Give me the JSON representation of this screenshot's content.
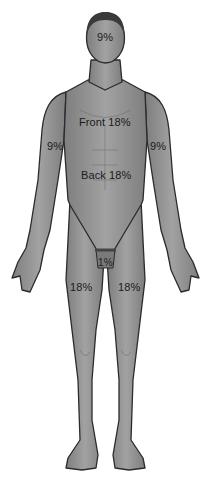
{
  "diagram": {
    "colors": {
      "skin": "#8e8e8e",
      "skin_light": "#a4a4a4",
      "outline": "#2b2b2b",
      "hair": "#3a3a3a",
      "label": "#1a1a1a",
      "background": "#ffffff"
    },
    "regions": [
      {
        "id": "head",
        "label": "9%"
      },
      {
        "id": "trunk-front",
        "label": "Front 18%"
      },
      {
        "id": "trunk-back",
        "label": "Back 18%"
      },
      {
        "id": "right-arm",
        "label": "9%"
      },
      {
        "id": "left-arm",
        "label": "9%"
      },
      {
        "id": "genitals",
        "label": "1%"
      },
      {
        "id": "right-leg",
        "label": "18%"
      },
      {
        "id": "left-leg",
        "label": "18%"
      }
    ]
  }
}
